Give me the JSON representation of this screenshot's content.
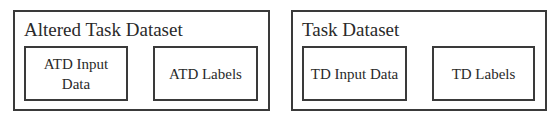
{
  "groups": [
    {
      "title": "Altered Task Dataset",
      "items": [
        {
          "line1": "ATD Input",
          "line2": "Data"
        },
        {
          "line1": "ATD Labels",
          "line2": ""
        }
      ]
    },
    {
      "title": "Task Dataset",
      "items": [
        {
          "line1": "TD Input Data",
          "line2": ""
        },
        {
          "line1": "TD Labels",
          "line2": ""
        }
      ]
    }
  ],
  "colors": {
    "stroke": "#3a3a3a",
    "text": "#2a2a2a",
    "background": "#ffffff"
  }
}
